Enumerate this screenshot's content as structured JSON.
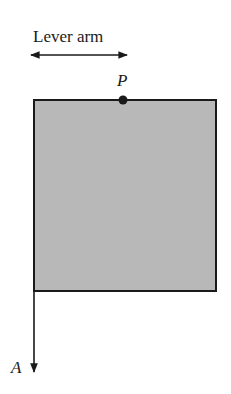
{
  "diagram": {
    "lever_arm_label": "Lever arm",
    "point_label": "P",
    "force_label": "A",
    "colors": {
      "box_fill": "#b8b8b8",
      "stroke": "#1a1a1a",
      "background": "#ffffff"
    }
  }
}
